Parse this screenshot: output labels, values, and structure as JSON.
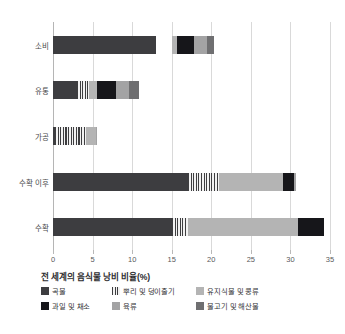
{
  "chart_data": {
    "type": "bar",
    "orientation": "horizontal",
    "stacked": true,
    "title": "전 세계의 음식물 낭비 비율(%)",
    "xlabel": "",
    "ylabel": "",
    "xlim": [
      0,
      35
    ],
    "xticks": [
      0,
      5,
      10,
      15,
      20,
      25,
      30,
      35
    ],
    "xtick_labels": [
      "0",
      "5",
      "10",
      "15",
      "20",
      "25",
      "30",
      "35"
    ],
    "grid": true,
    "legend_position": "bottom",
    "categories": [
      "소비",
      "유통",
      "가공",
      "수확 이후",
      "수확"
    ],
    "series": [
      {
        "name": "곡물",
        "color": "#3d3d40",
        "pattern": "solid",
        "values": [
          13.0,
          3.0,
          0.2,
          17.0,
          15.0
        ]
      },
      {
        "name": "뿌리 및 덩이줄기",
        "color": "#3e3e40",
        "pattern": "stripe",
        "values": [
          0.0,
          1.6,
          4.0,
          4.0,
          2.1
        ]
      },
      {
        "name": "유지식물 및 콩류",
        "color": "#b4b4b4",
        "pattern": "solid",
        "values": [
          0.7,
          1.0,
          1.2,
          8.0,
          13.9
        ]
      },
      {
        "name": "과일 및 채소",
        "color": "#16161a",
        "pattern": "solid",
        "values": [
          2.1,
          2.4,
          0.0,
          1.4,
          3.3
        ]
      },
      {
        "name": "육류",
        "color": "#a3a3a4",
        "pattern": "solid",
        "values": [
          1.7,
          1.6,
          0.2,
          0.3,
          0.0
        ]
      },
      {
        "name": "물고기 및 해산물",
        "color": "#6f6f71",
        "pattern": "solid",
        "values": [
          0.9,
          1.3,
          0.0,
          0.0,
          0.0
        ]
      }
    ],
    "series_offsets": [
      0.0,
      0.0,
      0.0,
      0.0,
      0.0
    ],
    "bar_gap_starts": [
      15.0,
      0.0,
      0.0,
      0.0,
      0.0
    ],
    "totals": [
      20.0,
      10.9,
      5.6,
      30.7,
      34.3
    ]
  },
  "axis": {
    "x_tick_labels": [
      "0",
      "5",
      "10",
      "15",
      "20",
      "25",
      "30",
      "35"
    ],
    "y_tick_labels": [
      "소비",
      "유통",
      "가공",
      "수확 이후",
      "수확"
    ]
  },
  "legend": {
    "title": "전 세계의 음식물 낭비 비율(%)",
    "items": [
      {
        "label": "곡물"
      },
      {
        "label": "뿌리 및 덩이줄기"
      },
      {
        "label": "유지식물 및 콩류"
      },
      {
        "label": "과일 및 채소"
      },
      {
        "label": "육류"
      },
      {
        "label": "물고기 및 해산물"
      }
    ]
  }
}
